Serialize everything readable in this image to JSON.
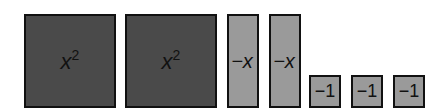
{
  "diagram": {
    "colors": {
      "square": "#4a4a4a",
      "negative": "#9a9a9a",
      "border": "#111111"
    },
    "tiles": [
      {
        "type": "x-squared",
        "var": "x",
        "exp": "2"
      },
      {
        "type": "x-squared",
        "var": "x",
        "exp": "2"
      },
      {
        "type": "neg-x",
        "label": "−x"
      },
      {
        "type": "neg-x",
        "label": "−x"
      },
      {
        "type": "neg-unit",
        "label": "−1"
      },
      {
        "type": "neg-unit",
        "label": "−1"
      },
      {
        "type": "neg-unit",
        "label": "−1"
      }
    ]
  }
}
